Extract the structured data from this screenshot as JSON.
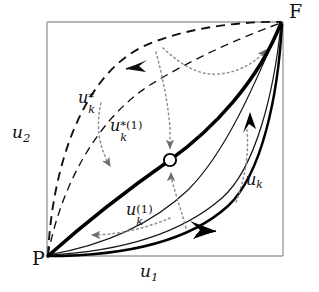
{
  "figure": {
    "type": "mathematical-diagram",
    "background_color": "#ffffff",
    "frame": {
      "color": "#9a9a9a",
      "left": 47,
      "top": 22,
      "right": 283,
      "bottom": 256
    },
    "corners": {
      "origin_label": "P",
      "final_label": "F"
    },
    "axes": {
      "x_label": "u",
      "x_sub": "1",
      "y_label": "u",
      "y_sub": "2"
    },
    "curves": [
      {
        "name": "u-star-k",
        "label_base": "u",
        "label_sub": "k",
        "label_sup": "*",
        "style": "dashed",
        "color": "#111111",
        "width": 1.8,
        "bow": "upper-left-outer",
        "arrow": "leftward"
      },
      {
        "name": "u-star-k-1",
        "label_base": "u",
        "label_sub": "k",
        "label_sup": "*(1)",
        "style": "dashed",
        "color": "#111111",
        "width": 1.3,
        "bow": "upper-left-inner",
        "arrow": "none"
      },
      {
        "name": "u-k-optimal",
        "label_base": "",
        "style": "solid-thick",
        "color": "#000000",
        "width": 3.4,
        "bow": "diagonal",
        "arrow": "upward-to-F",
        "marker": "open-circle"
      },
      {
        "name": "u-k",
        "label_base": "u",
        "label_sub": "k",
        "label_sup": "",
        "style": "solid-thin",
        "color": "#111111",
        "width": 1.2,
        "bow": "lower-right-outer",
        "arrow": "none"
      },
      {
        "name": "u-k-1",
        "label_base": "u",
        "label_sub": "k",
        "label_sup": "(1)",
        "style": "solid-thick-lower",
        "color": "#000000",
        "width": 2.6,
        "bow": "lower-right-inner",
        "arrow": "rightward"
      }
    ],
    "labels": {
      "corner_p": "P",
      "corner_f": "F",
      "axis_x_base": "u",
      "axis_x_sub": "1",
      "axis_y_base": "u",
      "axis_y_sub": "2",
      "curve_ustar_base": "u",
      "curve_ustar_sup": "*",
      "curve_ustar_sub": "k",
      "curve_ustar1_base": "u",
      "curve_ustar1_sup": "*(1)",
      "curve_ustar1_sub": "k",
      "curve_uk_base": "u",
      "curve_uk_sub": "k",
      "curve_uk1_base": "u",
      "curve_uk1_sup": "(1)",
      "curve_uk1_sub": "k"
    },
    "marker": {
      "name": "open-circle-node",
      "cx": 170,
      "cy": 160,
      "r": 6,
      "fill": "#ffffff",
      "stroke": "#000000"
    },
    "dotted_arcs": {
      "color": "#8d8d8d",
      "style": "dotted",
      "count": 6,
      "meaning": "convergence arrows toward the optimal trajectory and toward F"
    }
  }
}
